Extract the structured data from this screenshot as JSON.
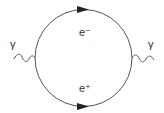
{
  "diagram": {
    "type": "feynman",
    "photon_left": {
      "label": "γ",
      "icon": "photon-wavy-line"
    },
    "photon_right": {
      "label": "γ",
      "icon": "photon-wavy-line"
    },
    "loop": {
      "upper_fermion": {
        "label": "e⁻",
        "arrow": "right"
      },
      "lower_fermion": {
        "label": "e⁺",
        "arrow": "right"
      }
    },
    "colors": {
      "line": "#444444",
      "text": "#333333",
      "background": "#ffffff"
    }
  }
}
